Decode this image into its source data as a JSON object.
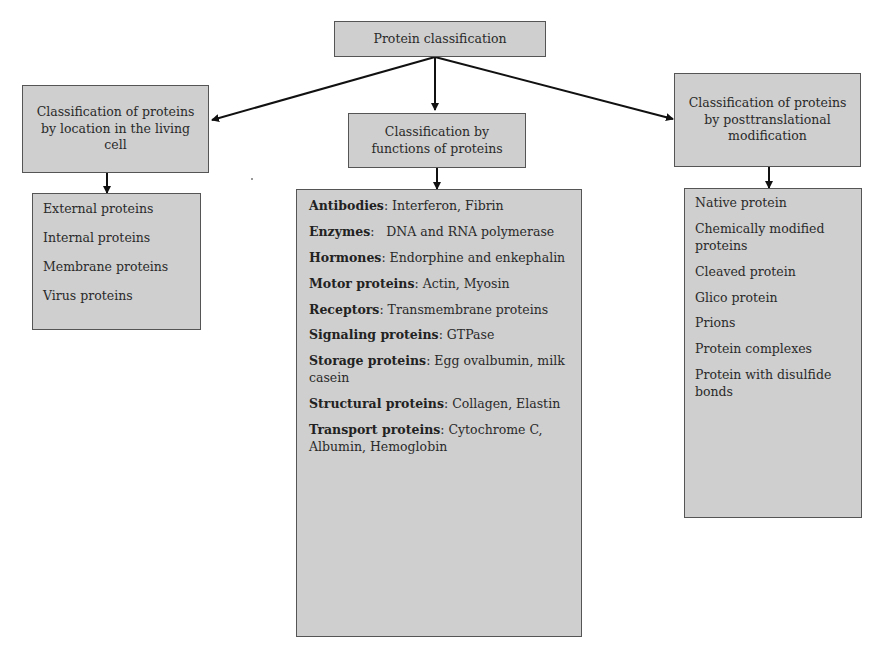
{
  "root": {
    "label": "Protein classification"
  },
  "branches": [
    {
      "id": "location",
      "label": "Classification of proteins by location in the living cell",
      "items": [
        {
          "text": "External proteins"
        },
        {
          "text": "Internal proteins"
        },
        {
          "text": "Membrane proteins"
        },
        {
          "text": "Virus proteins"
        }
      ]
    },
    {
      "id": "function",
      "label": "Classification by functions of proteins",
      "items": [
        {
          "term": "Antibodies",
          "desc": ": Interferon, Fibrin"
        },
        {
          "term": "Enzymes",
          "desc": ":   DNA and RNA polymerase"
        },
        {
          "term": "Hormones",
          "desc": ": Endorphine and enkephalin"
        },
        {
          "term": "Motor proteins",
          "desc": ": Actin, Myosin"
        },
        {
          "term": "Receptors",
          "desc": ": Transmembrane proteins"
        },
        {
          "term": "Signaling proteins",
          "desc": ": GTPase"
        },
        {
          "term": "Storage proteins",
          "desc": ": Egg ovalbumin, milk casein"
        },
        {
          "term": "Structural proteins",
          "desc": ": Collagen, Elastin"
        },
        {
          "term": "Transport proteins",
          "desc": ": Cytochrome C, Albumin, Hemoglobin"
        }
      ]
    },
    {
      "id": "posttranslational",
      "label": "Classification of proteins by posttranslational modification",
      "items": [
        {
          "text": "Native protein"
        },
        {
          "text": "Chemically modified proteins"
        },
        {
          "text": "Cleaved protein"
        },
        {
          "text": "Glico protein"
        },
        {
          "text": "Prions"
        },
        {
          "text": "Protein complexes"
        },
        {
          "text": "Protein with disulfide bonds"
        }
      ]
    }
  ]
}
